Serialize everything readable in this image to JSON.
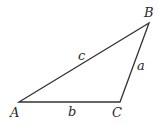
{
  "diagram": {
    "type": "triangle",
    "vertices": [
      {
        "name": "A",
        "label": "A"
      },
      {
        "name": "B",
        "label": "B"
      },
      {
        "name": "C",
        "label": "C"
      }
    ],
    "sides": [
      {
        "name": "a",
        "label": "a",
        "between": "B-C"
      },
      {
        "name": "b",
        "label": "b",
        "between": "A-C"
      },
      {
        "name": "c",
        "label": "c",
        "between": "A-B"
      }
    ],
    "stroke_color": "#333333"
  }
}
